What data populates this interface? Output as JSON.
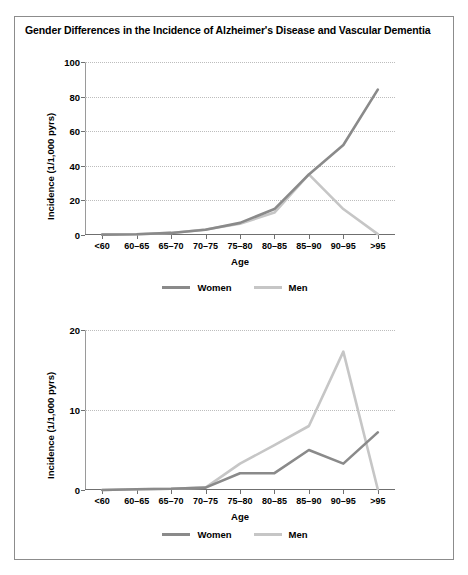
{
  "figure": {
    "title": "Gender Differences in the Incidence of Alzheimer's Disease and Vascular Dementia",
    "border_color": "#8c8c8c"
  },
  "colors": {
    "women": "#8a8a8a",
    "men": "#c6c6c6",
    "axis": "#6f6f6f",
    "grid": "#bdbdbd"
  },
  "legend": {
    "women_label": "Women",
    "men_label": "Men"
  },
  "chart_data": [
    {
      "type": "line",
      "id": "alzheimer",
      "title": "Alzheimer's disease",
      "xlabel": "Age",
      "ylabel": "Incidence (1/1,000 pyrs)",
      "categories": [
        "<60",
        "60–65",
        "65–70",
        "70–75",
        "75–80",
        "80–85",
        "85–90",
        "90–95",
        ">95"
      ],
      "ylim": [
        0,
        100
      ],
      "yticks": [
        0,
        20,
        40,
        60,
        80,
        100
      ],
      "grid": true,
      "legend_position": "bottom",
      "series": [
        {
          "name": "Women",
          "color": "#8a8a8a",
          "values": [
            0.2,
            0.4,
            1.2,
            3.0,
            7.0,
            15.0,
            35.0,
            52.0,
            84.0
          ]
        },
        {
          "name": "Men",
          "color": "#c6c6c6",
          "values": [
            0.2,
            0.4,
            1.2,
            3.2,
            6.5,
            13.0,
            35.0,
            15.0,
            0.5
          ]
        }
      ]
    },
    {
      "type": "line",
      "id": "vascular",
      "title": "Vascular dementia",
      "xlabel": "Age",
      "ylabel": "Incidence (1/1,000 pyrs)",
      "categories": [
        "<60",
        "60–65",
        "65–70",
        "70–75",
        "75–80",
        "80–85",
        "85–90",
        "90–95",
        ">95"
      ],
      "ylim": [
        0,
        20
      ],
      "yticks": [
        0,
        10,
        20
      ],
      "grid": true,
      "legend_position": "bottom",
      "series": [
        {
          "name": "Women",
          "color": "#8a8a8a",
          "values": [
            0.0,
            0.1,
            0.15,
            0.3,
            2.1,
            2.1,
            5.0,
            3.3,
            7.2
          ]
        },
        {
          "name": "Men",
          "color": "#c6c6c6",
          "values": [
            0.0,
            0.1,
            0.15,
            0.3,
            3.3,
            5.6,
            8.0,
            17.3,
            0.1
          ]
        }
      ]
    }
  ]
}
